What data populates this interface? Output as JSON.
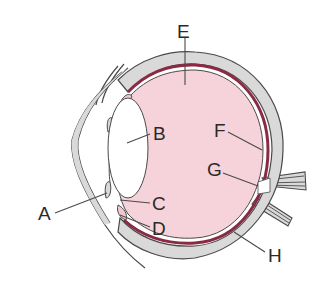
{
  "diagram": {
    "type": "eye cross-section",
    "colors": {
      "vitreous": "#f6d3da",
      "sclera": "#d9d9d9",
      "choroid": "#8a2a45",
      "outline": "#4a4a4a",
      "lens": "#ffffff"
    },
    "labels": [
      {
        "id": "A",
        "text": "A"
      },
      {
        "id": "B",
        "text": "B"
      },
      {
        "id": "C",
        "text": "C"
      },
      {
        "id": "D",
        "text": "D"
      },
      {
        "id": "E",
        "text": "E"
      },
      {
        "id": "F",
        "text": "F"
      },
      {
        "id": "G",
        "text": "G"
      },
      {
        "id": "H",
        "text": "H"
      }
    ]
  }
}
